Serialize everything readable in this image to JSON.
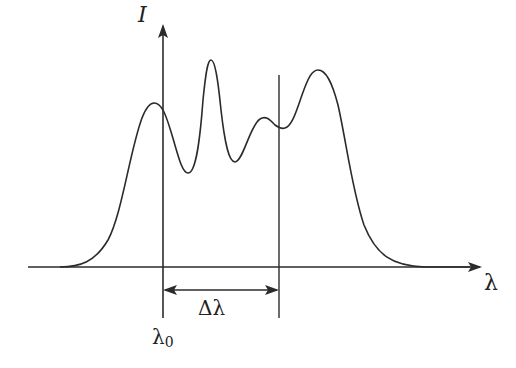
{
  "figure": {
    "type": "spectral-intensity-diagram",
    "y_axis_label": "I",
    "x_axis_label": "λ",
    "interval_label": "Δλ",
    "reference_label_base": "λ",
    "reference_label_sub": "0",
    "colors": {
      "line": "#2b2b2b",
      "background": "#ffffff"
    },
    "geometry": {
      "baseline_y": 267,
      "x_axis": {
        "x_start": 28,
        "x_end": 478
      },
      "y_axis": {
        "x": 163,
        "y_top": 24,
        "y_bottom": 318
      },
      "right_marker": {
        "x": 279,
        "y_top": 75,
        "y_bottom": 318
      },
      "interval_arrow_y": 290
    },
    "curve_features": [
      {
        "kind": "start",
        "x": 68,
        "y": 267
      },
      {
        "kind": "peak",
        "x": 153,
        "y": 103
      },
      {
        "kind": "valley",
        "x": 188,
        "y": 173
      },
      {
        "kind": "peak",
        "x": 210,
        "y": 60
      },
      {
        "kind": "valley",
        "x": 235,
        "y": 162
      },
      {
        "kind": "peak",
        "x": 264,
        "y": 118
      },
      {
        "kind": "valley",
        "x": 284,
        "y": 128
      },
      {
        "kind": "peak",
        "x": 318,
        "y": 70
      },
      {
        "kind": "end",
        "x": 420,
        "y": 267
      }
    ]
  }
}
